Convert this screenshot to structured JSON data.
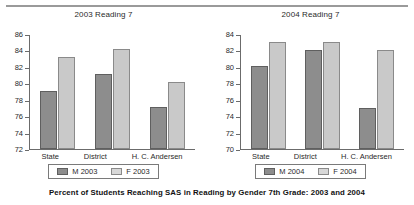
{
  "caption": "Percent of Students Reaching SAS in Reading by Gender 7th Grade: 2003 and 2004",
  "chart_data": [
    {
      "type": "bar",
      "title": "2003 Reading 7",
      "xlabel": "",
      "ylabel": "",
      "ylim": [
        72,
        86
      ],
      "yticks": [
        72,
        74,
        76,
        78,
        80,
        82,
        84,
        86
      ],
      "grid": false,
      "legend_position": "bottom",
      "categories": [
        "State",
        "District",
        "H. C. Andersen"
      ],
      "series": [
        {
          "name": "M 2003",
          "color": "#8d8d8d",
          "values": [
            79.1,
            81.1,
            77.1
          ]
        },
        {
          "name": "F 2003",
          "color": "#c9c9c9",
          "values": [
            83.2,
            84.2,
            80.1
          ]
        }
      ]
    },
    {
      "type": "bar",
      "title": "2004 Reading 7",
      "xlabel": "",
      "ylabel": "",
      "ylim": [
        70,
        84
      ],
      "yticks": [
        70,
        72,
        74,
        76,
        78,
        80,
        82,
        84
      ],
      "grid": false,
      "legend_position": "bottom",
      "categories": [
        "State",
        "District",
        "H. C. Andersen"
      ],
      "series": [
        {
          "name": "M 2004",
          "color": "#8d8d8d",
          "values": [
            80.1,
            82.0,
            75.0
          ]
        },
        {
          "name": "F 2004",
          "color": "#c9c9c9",
          "values": [
            83.0,
            83.0,
            82.0
          ]
        }
      ]
    }
  ]
}
